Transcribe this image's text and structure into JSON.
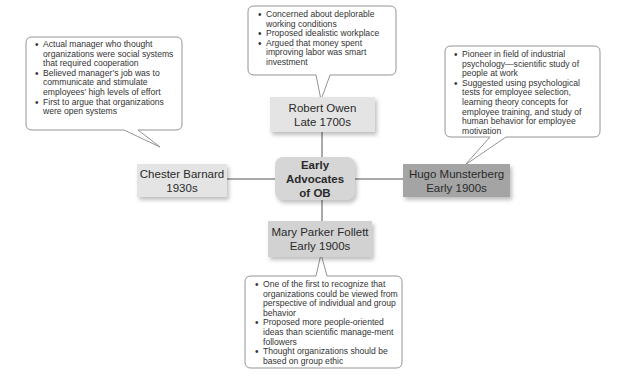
{
  "center": {
    "line1": "Early Advocates",
    "line2": "of OB"
  },
  "advocates": {
    "owen": {
      "name": "Robert Owen",
      "era": "Late 1700s",
      "points": [
        "Concerned about deplorable working conditions",
        "Proposed idealistic workplace",
        "Argued that money spent improving labor was smart investment"
      ]
    },
    "barnard": {
      "name": "Chester Barnard",
      "era": "1930s",
      "points": [
        "Actual manager who thought organizations were social systems that required cooperation",
        "Believed manager’s job was to communicate and stimulate employees’ high levels of effort",
        "First to argue that organizations were open systems"
      ]
    },
    "munsterberg": {
      "name": "Hugo Munsterberg",
      "era": "Early 1900s",
      "points": [
        "Pioneer in field of industrial psychology—scientific study of people at work",
        "Suggested using psychological tests for employee selection, learning theory concepts for employee training, and study of human behavior for employee motivation"
      ]
    },
    "follett": {
      "name": "Mary Parker Follett",
      "era": "Early 1900s",
      "points": [
        "One of the first to recognize that organizations could be viewed from perspective of individual and group behavior",
        "Proposed more people-oriented ideas than scientific manage-ment followers",
        "Thought organizations should be based on group ethic"
      ]
    }
  },
  "colors": {
    "light_box": "#e4e4e4",
    "center_box": "#d6d6d6",
    "dark_box": "#a4a4a4",
    "line": "#555555",
    "callout_border": "#888888"
  }
}
